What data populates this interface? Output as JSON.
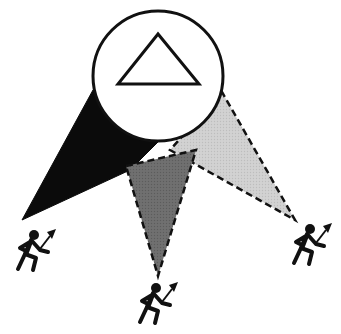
{
  "diagram": {
    "center_symbol": "triangle",
    "cones": [
      {
        "name": "left",
        "fill": "#0a0a0a",
        "style": "solid-black"
      },
      {
        "name": "center",
        "fill": "#6e6e6e",
        "style": "dashed-dark-gray"
      },
      {
        "name": "right",
        "fill": "#cfcfcf",
        "style": "dashed-light-gray"
      }
    ],
    "figures": [
      {
        "name": "left-runner",
        "icon": "runner-with-torch-icon"
      },
      {
        "name": "center-runner",
        "icon": "runner-with-torch-icon"
      },
      {
        "name": "right-runner",
        "icon": "runner-with-torch-icon"
      }
    ],
    "colors": {
      "ink": "#111111",
      "background": "#ffffff"
    }
  }
}
